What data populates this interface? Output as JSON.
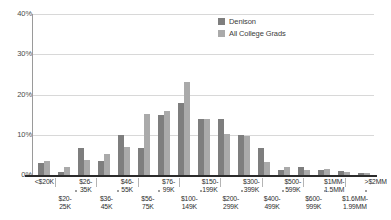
{
  "chart_data": {
    "type": "bar",
    "title": "",
    "xlabel": "",
    "ylabel": "",
    "ylim": [
      0,
      40
    ],
    "grid": true,
    "legend_position": "top-right",
    "ytick_labels": [
      "0%",
      "10%",
      "20%",
      "30%",
      "40%"
    ],
    "ytick_values": [
      0,
      10,
      20,
      30,
      40
    ],
    "categories": [
      "<$20K",
      "$20-25K",
      "$26-35K",
      "$36-45K",
      "$46-55K",
      "$56-75K",
      "$76-99K",
      "$100-149K",
      "$150-199K",
      "$200-299K",
      "$300-399K",
      "$400-499K",
      "$500-599K",
      "$600-999K",
      "$1MM-1.5MM",
      "$1.6MM-1.99MM",
      ">$2MM"
    ],
    "series": [
      {
        "name": "Denison",
        "color": "#7e7e7e",
        "values": [
          3.0,
          0.8,
          6.8,
          3.4,
          10.0,
          6.7,
          15.0,
          17.8,
          14.0,
          14.0,
          9.9,
          6.6,
          1.2,
          1.9,
          1.2,
          0.9,
          0.5
        ]
      },
      {
        "name": "All College Grads",
        "color": "#aaaaaa",
        "values": [
          3.5,
          2.0,
          3.8,
          5.2,
          7.0,
          15.2,
          15.9,
          23.2,
          14.0,
          10.1,
          9.8,
          3.3,
          2.1,
          1.3,
          1.5,
          0.7,
          0.4
        ]
      }
    ]
  },
  "legend": {
    "items": [
      {
        "label": "Denison",
        "color": "#7e7e7e"
      },
      {
        "label": "All College Grads",
        "color": "#aaaaaa"
      }
    ]
  },
  "xaxis": {
    "labels": [
      {
        "text": "<$20K",
        "row": "top"
      },
      {
        "text": "$20-\n25K",
        "row": "bot"
      },
      {
        "text": "$26-\n35K",
        "row": "top"
      },
      {
        "text": "$36-\n45K",
        "row": "bot"
      },
      {
        "text": "$46-\n55K",
        "row": "top"
      },
      {
        "text": "$56-\n75K",
        "row": "bot"
      },
      {
        "text": "$76-\n99K",
        "row": "top"
      },
      {
        "text": "$100-\n149K",
        "row": "bot"
      },
      {
        "text": "$150-\n199K",
        "row": "top"
      },
      {
        "text": "$200-\n299K",
        "row": "bot"
      },
      {
        "text": "$300-\n399K",
        "row": "top"
      },
      {
        "text": "$400-\n499K",
        "row": "bot"
      },
      {
        "text": "$500-\n599K",
        "row": "top"
      },
      {
        "text": "$600-\n999K",
        "row": "bot"
      },
      {
        "text": "$1MM-\n1.5MM",
        "row": "top"
      },
      {
        "text": "$1.6MM-\n1.99MM",
        "row": "bot"
      },
      {
        "text": ">$2MM",
        "row": "top"
      }
    ]
  }
}
